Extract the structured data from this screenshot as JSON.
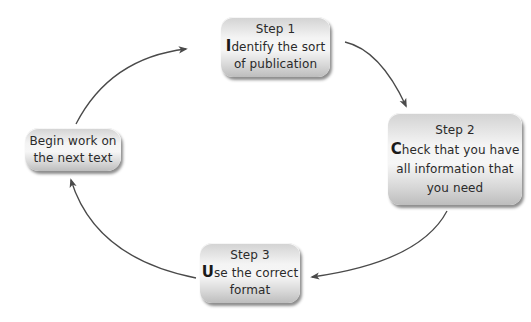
{
  "diagram": {
    "type": "cycle",
    "nodes": [
      {
        "id": "step1",
        "title": "Step 1",
        "initial": "I",
        "rest_line1": "dentify the sort",
        "line2": "of publication"
      },
      {
        "id": "step2",
        "title": "Step 2",
        "initial": "C",
        "rest_line1": "heck that you have",
        "line2": "all information that",
        "line3": "you need"
      },
      {
        "id": "step3",
        "title": "Step 3",
        "initial": "U",
        "rest_line1": "se the correct",
        "line2": "format"
      },
      {
        "id": "begin",
        "line1": "Begin work on",
        "line2": "the next text"
      }
    ],
    "edges": [
      {
        "from": "step1",
        "to": "step2"
      },
      {
        "from": "step2",
        "to": "step3"
      },
      {
        "from": "step3",
        "to": "begin"
      },
      {
        "from": "begin",
        "to": "step1"
      }
    ],
    "colors": {
      "arrow": "#4a4a4a",
      "node_text": "#2a2a2a",
      "background": "#ffffff"
    }
  }
}
